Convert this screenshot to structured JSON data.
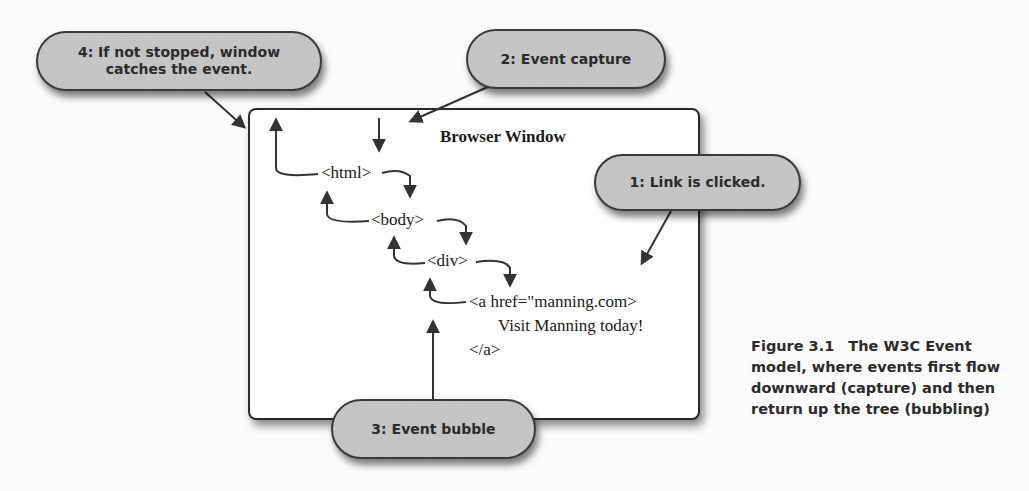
{
  "diagram": {
    "box_title": "Browser Window",
    "tags": {
      "html": "<html>",
      "body": "<body>",
      "div": "<div>",
      "anchor_open": "<a href=\"manning.com>",
      "anchor_text": "Visit Manning today!",
      "anchor_close": "</a>"
    },
    "callouts": {
      "step1": "1: Link is clicked.",
      "step2": "2: Event capture",
      "step3": "3: Event bubble",
      "step4_line1": "4: If not stopped, window",
      "step4_line2": "catches the event."
    },
    "colors": {
      "bubble_fill": "#c3c3c3",
      "bubble_border": "#3a3a3a",
      "arrow": "#333333",
      "box_border": "#2a2a2a",
      "text": "#1a1a1a"
    }
  },
  "caption": {
    "figure_number": "Figure 3.1",
    "text": "The W3C Event model, where events first flow downward (capture) and then return up the tree (bubbling)"
  }
}
